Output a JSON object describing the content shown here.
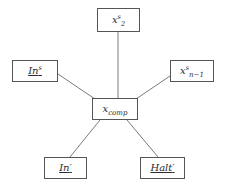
{
  "diagram": {
    "type": "node-link-graph",
    "title": "",
    "background_color": "#ffffff",
    "edge_color": "#6b6b6b",
    "node_border_color": "#555555",
    "node_fill_color": "#ffffff",
    "text_color": "#2b2b2b",
    "nodes": [
      {
        "id": "x2s",
        "name": "node-x2s",
        "base": "x",
        "superscript": "s",
        "subscript": "2",
        "prime": "",
        "underlined": false,
        "plain_text": "x^s_2",
        "x": 97,
        "y": 8,
        "width": 43,
        "height": 24
      },
      {
        "id": "ins",
        "name": "node-in-s",
        "base": "In",
        "superscript": "s",
        "subscript": "",
        "prime": "",
        "underlined": true,
        "plain_text": "In^s",
        "x": 12,
        "y": 60,
        "width": 46,
        "height": 22
      },
      {
        "id": "xn1s",
        "name": "node-xn-1-s",
        "base": "x",
        "superscript": "s",
        "subscript": "n−1",
        "prime": "",
        "underlined": false,
        "plain_text": "x^s_{n-1}",
        "x": 170,
        "y": 60,
        "width": 44,
        "height": 22
      },
      {
        "id": "xcomp",
        "name": "node-x-comp",
        "base": "x",
        "superscript": "",
        "subscript": "comp",
        "prime": "",
        "underlined": false,
        "plain_text": "x_comp",
        "x": 92,
        "y": 98,
        "width": 46,
        "height": 22
      },
      {
        "id": "inprime",
        "name": "node-in-prime",
        "base": "In",
        "superscript": "",
        "subscript": "",
        "prime": "′",
        "underlined": true,
        "plain_text": "In'",
        "x": 44,
        "y": 157,
        "width": 43,
        "height": 22
      },
      {
        "id": "haltprime",
        "name": "node-halt-prime",
        "base": "Halt",
        "superscript": "",
        "subscript": "",
        "prime": "′",
        "underlined": true,
        "plain_text": "Halt'",
        "x": 140,
        "y": 157,
        "width": 45,
        "height": 22
      }
    ],
    "edges": [
      {
        "name": "edge-x2s-to-xcomp",
        "from": "x2s",
        "to": "xcomp",
        "x1": 118,
        "y1": 32,
        "x2": 118,
        "y2": 98
      },
      {
        "name": "edge-ins-to-xcomp",
        "from": "ins",
        "to": "xcomp",
        "x1": 58,
        "y1": 74,
        "x2": 95,
        "y2": 99
      },
      {
        "name": "edge-xn1s-to-xcomp",
        "from": "xn1s",
        "to": "xcomp",
        "x1": 170,
        "y1": 76,
        "x2": 136,
        "y2": 99
      },
      {
        "name": "edge-xcomp-to-inprime",
        "from": "xcomp",
        "to": "inprime",
        "x1": 100,
        "y1": 120,
        "x2": 70,
        "y2": 157
      },
      {
        "name": "edge-xcomp-to-haltprime",
        "from": "xcomp",
        "to": "haltprime",
        "x1": 127,
        "y1": 120,
        "x2": 158,
        "y2": 157
      }
    ]
  }
}
